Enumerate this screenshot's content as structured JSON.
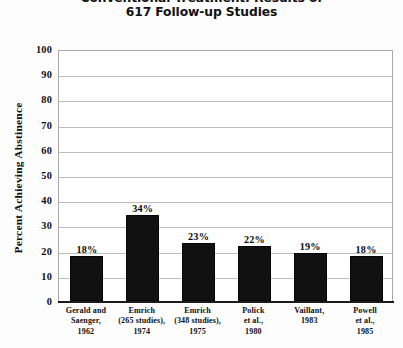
{
  "chart_data": {
    "type": "bar",
    "title": "Conventional Treatment: Results of 617 Follow-up Studies",
    "title_lines": [
      "Conventional Treatment: Results of",
      "617 Follow-up Studies"
    ],
    "xlabel": "",
    "ylabel": "Percent Achieving Abstinence",
    "ylim": [
      0,
      100
    ],
    "yticks": [
      100,
      90,
      80,
      70,
      60,
      50,
      40,
      30,
      20,
      10,
      0
    ],
    "grid": true,
    "legend": false,
    "bar_color": "#111111",
    "categories": [
      "Gerald and Saenger, 1962",
      "Emrich (265 studies), 1974",
      "Emrich (348 studies), 1975",
      "Polick et al., 1980",
      "Vaillant, 1983",
      "Powell et al., 1985"
    ],
    "category_lines": [
      [
        "Gerald and",
        "Saenger,",
        "1962"
      ],
      [
        "Emrich",
        "(265 studies),",
        "1974"
      ],
      [
        "Emrich",
        "(348 studies),",
        "1975"
      ],
      [
        "Polick",
        "et al.,",
        "1980"
      ],
      [
        "Vaillant,",
        "1983"
      ],
      [
        "Powell",
        "et al.,",
        "1985"
      ]
    ],
    "values": [
      18,
      34,
      23,
      22,
      19,
      18
    ],
    "value_labels": [
      "18%",
      "34%",
      "23%",
      "22%",
      "19%",
      "18%"
    ]
  }
}
